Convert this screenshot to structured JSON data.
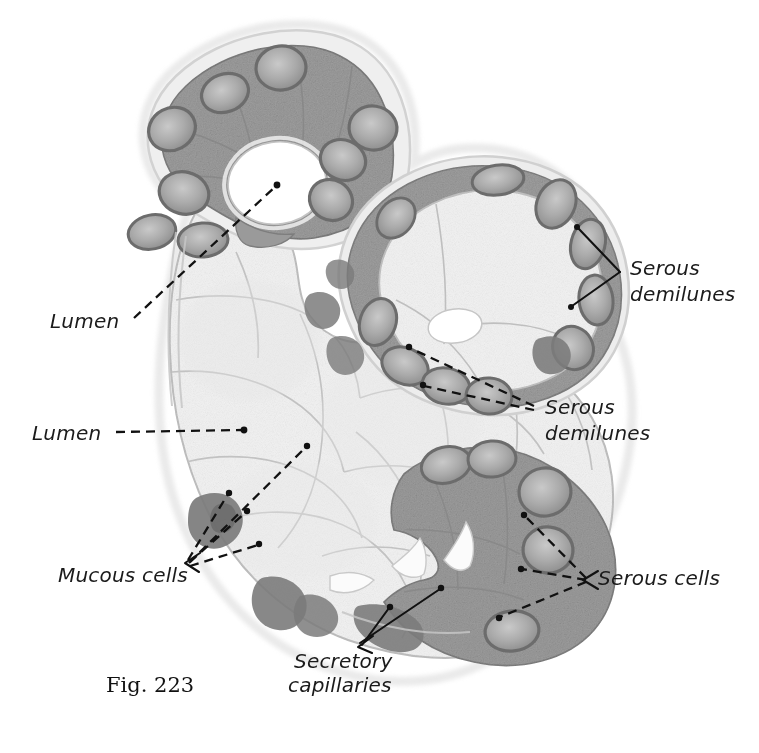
{
  "figure": {
    "caption": "Fig. 223",
    "background_color": "#ffffff"
  },
  "palette": {
    "serous_cytoplasm": "#9a9a9a",
    "serous_cytoplasm_dark": "#8a8a8a",
    "mucous_cytoplasm": "#f1f1f1",
    "mucous_outline": "#b4b4b4",
    "nucleus_rim": "#6f6f6f",
    "nucleus_fill": "#a5a5a5",
    "basophilic_blob": "#7e7e7e",
    "lumen_white": "#ffffff",
    "capsule": "#d8d8d8",
    "label_text": "#1b1b1b"
  },
  "labels": [
    {
      "id": "lumen-top",
      "text": "Lumen",
      "lines": [
        "Lumen"
      ],
      "x": 50,
      "y": 328,
      "anchor": "start"
    },
    {
      "id": "lumen-mid",
      "text": "Lumen",
      "lines": [
        "Lumen"
      ],
      "x": 32,
      "y": 440,
      "anchor": "start"
    },
    {
      "id": "mucous-cells",
      "text": "Mucous cells",
      "lines": [
        "Mucous cells"
      ],
      "x": 58,
      "y": 582,
      "anchor": "start"
    },
    {
      "id": "secretory-capillaries",
      "text": "Secretory capillaries",
      "lines": [
        "Secretory",
        "capillaries"
      ],
      "x": 294,
      "y": 668,
      "anchor": "start"
    },
    {
      "id": "serous-demilunes-top",
      "text": "Serous demilunes",
      "lines": [
        "Serous",
        "demilunes"
      ],
      "x": 630,
      "y": 275,
      "anchor": "start"
    },
    {
      "id": "serous-demilunes-mid",
      "text": "Serous demilunes",
      "lines": [
        "Serous",
        "demilunes"
      ],
      "x": 545,
      "y": 414,
      "anchor": "start"
    },
    {
      "id": "serous-cells",
      "text": "Serous cells",
      "lines": [
        "Serous cells"
      ],
      "x": 598,
      "y": 585,
      "anchor": "start"
    }
  ],
  "structures": {
    "top_acinus": {
      "name": "serous-capped acinus",
      "lumen": "central white lumen"
    },
    "right_acinus": {
      "name": "mucous acinus with serous demilunes",
      "lumen": "small central lumen"
    },
    "main_body": {
      "name": "mucous acinus body",
      "cells": "pale mucous cells"
    },
    "lower_right": {
      "name": "serous cell region with secretory capillaries"
    }
  }
}
